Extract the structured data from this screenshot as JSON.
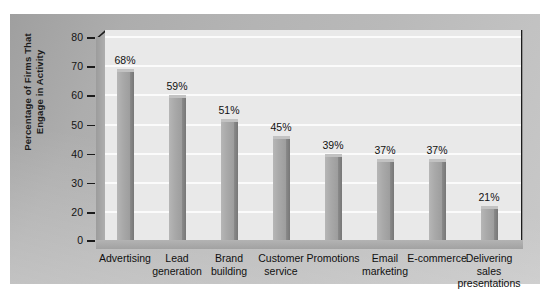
{
  "chart_data": {
    "type": "bar",
    "title": "",
    "xlabel": "",
    "ylabel": "Percentage of Firms That\nEngage in Activity",
    "categories": [
      "Advertising",
      "Lead\ngeneration",
      "Brand\nbuilding",
      "Customer\nservice",
      "Promotions",
      "Email\nmarketing",
      "E-commerce",
      "Delivering\nsales\npresentations"
    ],
    "values": [
      68,
      59,
      51,
      45,
      39,
      37,
      37,
      21
    ],
    "value_labels": [
      "68%",
      "59%",
      "51%",
      "45%",
      "39%",
      "37%",
      "37%",
      "21%"
    ],
    "ylim": [
      0,
      80
    ],
    "yticks": [
      0,
      20,
      30,
      40,
      50,
      60,
      70,
      80
    ],
    "ytick_labels": [
      "0",
      "20",
      "30",
      "40",
      "50",
      "60",
      "70",
      "80"
    ],
    "grid": true,
    "legend": "none",
    "colors": {
      "bar_face": "#a9a9a9",
      "bar_side": "#7d7d7d",
      "plot_background": "#e9e9e9",
      "panel_background": "#b4b4b4",
      "gridline": "#fbfbfb",
      "axis": "#1b1b1b",
      "text": "#111111"
    }
  }
}
